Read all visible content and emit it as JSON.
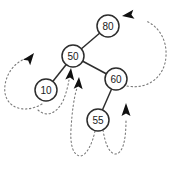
{
  "diagram": {
    "type": "binary-search-tree",
    "background_color": "#ffffff",
    "node_stroke_color": "#2d2d2d",
    "node_fill_color": "#ffffff",
    "edge_color": "#2d2d2d",
    "dotted_arrow_color": "#7a7a7a",
    "arrowhead_color": "#101010",
    "nodes": [
      {
        "id": "n80",
        "label": "80"
      },
      {
        "id": "n50",
        "label": "50"
      },
      {
        "id": "n60",
        "label": "60"
      },
      {
        "id": "n10",
        "label": "10"
      },
      {
        "id": "n55",
        "label": "55"
      }
    ],
    "edges": [
      {
        "from": "80",
        "to": "50"
      },
      {
        "from": "50",
        "to": "10"
      },
      {
        "from": "50",
        "to": "60"
      },
      {
        "from": "60",
        "to": "55"
      }
    ],
    "arrows": [
      {
        "id": "arrow-loop-left-of-10",
        "style": "dotted-curve",
        "points": "up-right toward left side of 50"
      },
      {
        "id": "arrow-from-10-to-50",
        "style": "dotted-curve",
        "points": "up at bottom of 50"
      },
      {
        "id": "arrow-from-55-to-50",
        "style": "dotted-curve",
        "points": "up at bottom-right of 50"
      },
      {
        "id": "arrow-from-55-to-60",
        "style": "dotted-curve",
        "points": "up toward 60, right of 55"
      },
      {
        "id": "arrow-from-60-to-80",
        "style": "dotted-curve",
        "points": "left toward right side of 80"
      }
    ]
  }
}
